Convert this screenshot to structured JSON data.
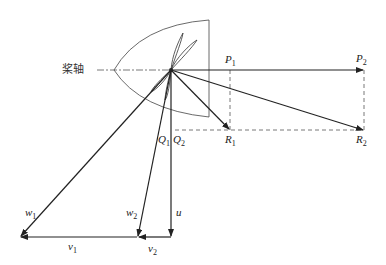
{
  "diagram": {
    "title": "",
    "axis_label": "桨轴",
    "points": {
      "P1": {
        "name": "P",
        "sub": "1"
      },
      "P2": {
        "name": "P",
        "sub": "2"
      },
      "R1": {
        "name": "R",
        "sub": "1"
      },
      "R2": {
        "name": "R",
        "sub": "2"
      },
      "Q1": {
        "name": "Q",
        "sub": "1"
      },
      "Q2": {
        "name": "Q",
        "sub": "2"
      }
    },
    "vectors": {
      "w1": {
        "name": "w",
        "sub": "1"
      },
      "w2": {
        "name": "w",
        "sub": "2"
      },
      "u": {
        "name": "u",
        "sub": ""
      },
      "v1": {
        "name": "v",
        "sub": "1"
      },
      "v2": {
        "name": "v",
        "sub": "2"
      }
    },
    "colors": {
      "line": "#222222",
      "dashed": "#555555",
      "outline": "#444444"
    }
  }
}
